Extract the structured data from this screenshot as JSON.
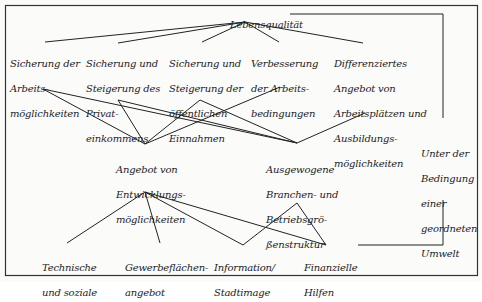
{
  "diagram": {
    "root": {
      "id": "lebensqualitaet",
      "lines": [
        "Lebensqualität"
      ]
    },
    "goals": [
      {
        "id": "sicherung-arbeitsmoeglichkeiten",
        "lines": [
          "Sicherung der",
          "Arbeits-",
          "möglichkeiten"
        ]
      },
      {
        "id": "sicherung-privateinkommen",
        "lines": [
          "Sicherung und",
          "Steigerung des",
          "Privat-",
          "einkommens"
        ]
      },
      {
        "id": "sicherung-oeffentliche-einnahmen",
        "lines": [
          "Sicherung und",
          "Steigerung der",
          "öffentlichen",
          "Einnahmen"
        ]
      },
      {
        "id": "verbesserung-arbeitsbedingungen",
        "lines": [
          "Verbesserung",
          "der Arbeits-",
          "bedingungen"
        ]
      },
      {
        "id": "differenziertes-angebot",
        "lines": [
          "Differenziertes",
          "Angebot von",
          "Arbeitsplätzen und",
          "Ausbildungs-",
          "möglichkeiten"
        ]
      }
    ],
    "strategies": [
      {
        "id": "angebot-entwicklungsmoeglichkeiten",
        "lines": [
          "Angebot von",
          "Entwicklungs-",
          "möglichkeiten"
        ]
      },
      {
        "id": "ausgewogene-struktur",
        "lines": [
          "Ausgewogene",
          "Branchen- und",
          "Betriebsgrö-",
          "ßenstruktur"
        ]
      }
    ],
    "measures": [
      {
        "id": "technische-soziale",
        "lines": [
          "Technische",
          "und soziale"
        ]
      },
      {
        "id": "gewerbeflaechenangebot",
        "lines": [
          "Gewerbeflächen-",
          "angebot"
        ]
      },
      {
        "id": "information-stadtimage",
        "lines": [
          "Information/",
          "Stadtimage"
        ]
      },
      {
        "id": "finanzielle-hilfen",
        "lines": [
          "Finanzielle",
          "Hilfen"
        ]
      }
    ],
    "condition": {
      "id": "umwelt-bedingung",
      "lines": [
        "Unter der",
        "Bedingung",
        "einer",
        "geordneten",
        "Umwelt"
      ]
    },
    "edges": [
      {
        "from": "lebensqualitaet",
        "to": "sicherung-arbeitsmoeglichkeiten"
      },
      {
        "from": "lebensqualitaet",
        "to": "sicherung-privateinkommen"
      },
      {
        "from": "lebensqualitaet",
        "to": "sicherung-oeffentliche-einnahmen"
      },
      {
        "from": "lebensqualitaet",
        "to": "verbesserung-arbeitsbedingungen"
      },
      {
        "from": "lebensqualitaet",
        "to": "differenziertes-angebot"
      },
      {
        "from": "sicherung-arbeitsmoeglichkeiten",
        "to": "angebot-entwicklungsmoeglichkeiten"
      },
      {
        "from": "sicherung-arbeitsmoeglichkeiten",
        "to": "ausgewogene-struktur"
      },
      {
        "from": "sicherung-privateinkommen",
        "to": "angebot-entwicklungsmoeglichkeiten"
      },
      {
        "from": "sicherung-privateinkommen",
        "to": "ausgewogene-struktur"
      },
      {
        "from": "sicherung-oeffentliche-einnahmen",
        "to": "angebot-entwicklungsmoeglichkeiten"
      },
      {
        "from": "sicherung-oeffentliche-einnahmen",
        "to": "ausgewogene-struktur"
      },
      {
        "from": "verbesserung-arbeitsbedingungen",
        "to": "angebot-entwicklungsmoeglichkeiten"
      },
      {
        "from": "differenziertes-angebot",
        "to": "ausgewogene-struktur"
      },
      {
        "from": "angebot-entwicklungsmoeglichkeiten",
        "to": "technische-soziale"
      },
      {
        "from": "angebot-entwicklungsmoeglichkeiten",
        "to": "gewerbeflaechenangebot"
      },
      {
        "from": "angebot-entwicklungsmoeglichkeiten",
        "to": "information-stadtimage"
      },
      {
        "from": "angebot-entwicklungsmoeglichkeiten",
        "to": "finanzielle-hilfen"
      },
      {
        "from": "ausgewogene-struktur",
        "to": "information-stadtimage"
      },
      {
        "from": "ausgewogene-struktur",
        "to": "finanzielle-hilfen"
      },
      {
        "from": "lebensqualitaet",
        "to": "finanzielle-hilfen",
        "via": "umwelt-bedingung",
        "style": "orthogonal-bracket"
      }
    ],
    "colors": {
      "line": "#222222",
      "text": "#1c1c1c",
      "background": "#fbfbfa",
      "frame": "#333333"
    }
  }
}
